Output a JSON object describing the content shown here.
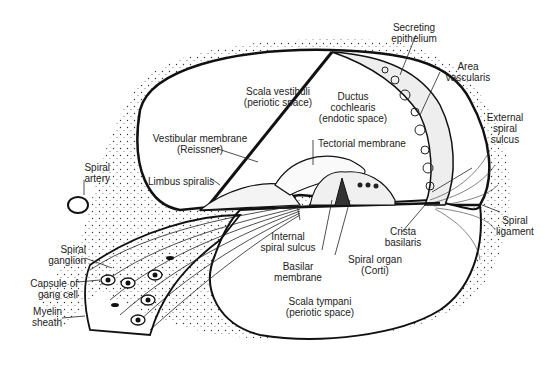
{
  "labels": {
    "scala_vestibuli": {
      "line1": "Scala vestibuli",
      "line2": "(periotic space)"
    },
    "secreting_epithelium": {
      "line1": "Secreting",
      "line2": "epithelium"
    },
    "area_vascularis": {
      "line1": "Area",
      "line2": "vascularis"
    },
    "ductus_cochlearis": {
      "line1": "Ductus",
      "line2": "cochlearis",
      "line3": "(endotic space)"
    },
    "external_spiral_sulcus": {
      "line1": "External",
      "line2": "spiral",
      "line3": "sulcus"
    },
    "vestibular_membrane": {
      "line1": "Vestibular membrane",
      "line2": "(Reissner)"
    },
    "tectorial_membrane": {
      "line1": "Tectorial membrane"
    },
    "spiral_artery": {
      "line1": "Spiral",
      "line2": "artery"
    },
    "limbus_spiralis": {
      "line1": "Limbus spiralis"
    },
    "spiral_ligament": {
      "line1": "Spiral",
      "line2": "ligament"
    },
    "internal_spiral_sulcus": {
      "line1": "Internal",
      "line2": "spiral sulcus"
    },
    "crista_basilaris": {
      "line1": "Crista",
      "line2": "basilaris"
    },
    "spiral_ganglion": {
      "line1": "Spiral",
      "line2": "ganglion"
    },
    "basilar_membrane": {
      "line1": "Basilar",
      "line2": "membrane"
    },
    "spiral_organ": {
      "line1": "Spiral organ",
      "line2": "(Corti)"
    },
    "capsule_gang_cell": {
      "line1": "Capsule of",
      "line2": "gang cell"
    },
    "myelin_sheath": {
      "line1": "Myelin",
      "line2": "sheath"
    },
    "scala_tympani": {
      "line1": "Scala tympani",
      "line2": "(periotic space)"
    }
  },
  "colors": {
    "ink": "#1a1a1a",
    "background": "#ffffff"
  }
}
